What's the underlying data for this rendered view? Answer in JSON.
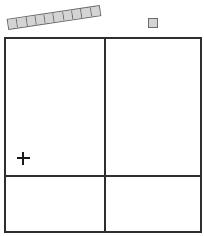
{
  "tray": {
    "cells": 10,
    "color": "#d4d4d4",
    "border_color": "#6b6b6b",
    "rotation_deg": -8.5
  },
  "single_piece": {
    "color": "#d4d4d4",
    "border_color": "#6b6b6b"
  },
  "board": {
    "border_color": "#2e2e2e",
    "regions": [
      {
        "id": "top-left"
      },
      {
        "id": "top-right"
      },
      {
        "id": "bottom-left"
      },
      {
        "id": "bottom-right"
      }
    ]
  },
  "cursor": {
    "icon": "plus-icon"
  }
}
